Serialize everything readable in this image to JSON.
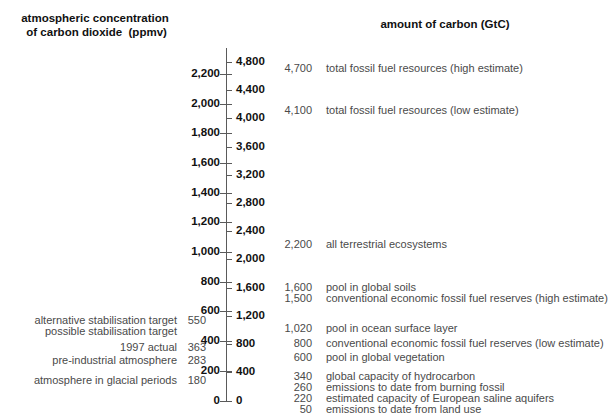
{
  "headers": {
    "left": "atmospheric concentration\n of carbon dioxide  (ppmv)",
    "right": "amount of carbon (GtC)"
  },
  "chart_data": {
    "type": "table",
    "xlabel": "",
    "ylabel": "atmospheric concentration of carbon dioxide (ppmv) / amount of carbon (GtC)",
    "grid": false,
    "legend": "none",
    "axes": [
      {
        "name": "ppmv",
        "label": "atmospheric concentration of carbon dioxide (ppmv)",
        "side": "left",
        "ylim": [
          0,
          2300
        ],
        "tick_step": 200,
        "ticks": [
          0,
          200,
          400,
          600,
          800,
          1000,
          1200,
          1400,
          1600,
          1800,
          2000,
          2200
        ],
        "tick_labels": [
          "0",
          "200",
          "400",
          "600",
          "800",
          "1,000",
          "1,200",
          "1,400",
          "1,600",
          "1,800",
          "2,000",
          "2,200"
        ]
      },
      {
        "name": "gtc",
        "label": "amount of carbon (GtC)",
        "side": "right",
        "ylim": [
          0,
          5000
        ],
        "tick_step": 400,
        "ticks": [
          0,
          400,
          800,
          1200,
          1600,
          2000,
          2400,
          2800,
          3200,
          3600,
          4000,
          4400,
          4800
        ],
        "tick_labels": [
          "0",
          "400",
          "800",
          "1,200",
          "1,600",
          "2,000",
          "2,400",
          "2,800",
          "3,200",
          "3,600",
          "4,000",
          "4,400",
          "4,800"
        ]
      }
    ],
    "ppmv_annotations": [
      {
        "value": 550,
        "value_label": "550",
        "label": "alternative stabilisation target"
      },
      {
        "value": null,
        "value_label": "",
        "label": "possible stabilisation target"
      },
      {
        "value": 363,
        "value_label": "363",
        "label": "1997 actual"
      },
      {
        "value": 283,
        "value_label": "283",
        "label": "pre-industrial atmosphere"
      },
      {
        "value": 180,
        "value_label": "180",
        "label": "atmosphere in glacial periods"
      }
    ],
    "gtc_annotations": [
      {
        "value": 4700,
        "value_label": "4,700",
        "label": "total fossil fuel resources (high estimate)"
      },
      {
        "value": 4100,
        "value_label": "4,100",
        "label": "total fossil fuel resources (low estimate)"
      },
      {
        "value": 2200,
        "value_label": "2,200",
        "label": "all terrestrial ecosystems"
      },
      {
        "value": 1600,
        "value_label": "1,600",
        "label": "pool in global soils"
      },
      {
        "value": 1500,
        "value_label": "1,500",
        "label": "conventional economic fossil fuel reserves (high estimate)"
      },
      {
        "value": 1020,
        "value_label": "1,020",
        "label": "pool in ocean surface layer"
      },
      {
        "value": 800,
        "value_label": "800",
        "label": "conventional economic fossil fuel reserves (low estimate)"
      },
      {
        "value": 600,
        "value_label": "600",
        "label": "pool in global vegetation"
      },
      {
        "value": 340,
        "value_label": "340",
        "label": "global capacity of hydrocarbon"
      },
      {
        "value": 260,
        "value_label": "260",
        "label": "emissions to date from burning fossil"
      },
      {
        "value": 220,
        "value_label": "220",
        "label": "estimated capacity of European saline aquifers"
      },
      {
        "value": 50,
        "value_label": "50",
        "label": "emissions to date from land use"
      }
    ]
  },
  "colors": {
    "background": "#ffffff",
    "axis": "#5a5a5a",
    "heading_text": "#111111",
    "scale_text": "#111111",
    "annotation_text": "#4a4a4a"
  }
}
